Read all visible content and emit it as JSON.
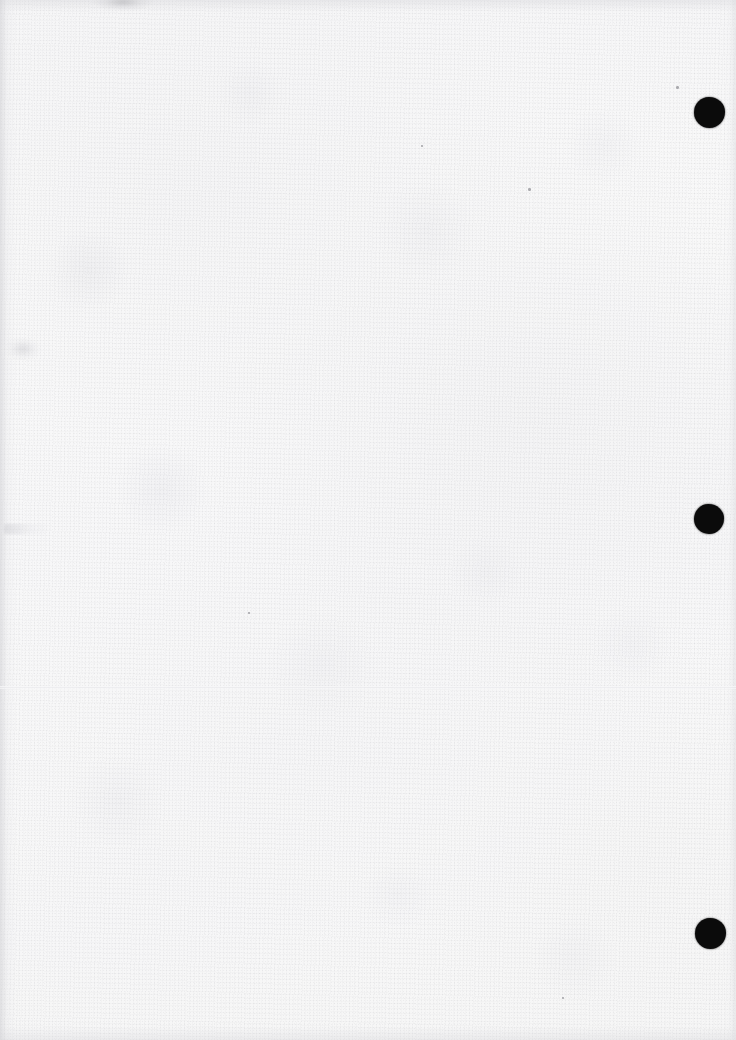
{
  "document": {
    "kind": "scanned-page",
    "title": "Scanned blank sheet",
    "description": "Blank off-white scanned paper page with three punched binding holes along the right edge",
    "page_width": 736,
    "page_height": 1040,
    "visible_text": "",
    "colors": {
      "paper": "#f8f8f8",
      "paper_shade": "#f2f2f3",
      "hole": "#0b0b0b",
      "edge_shadow": "#cecece",
      "smudge": "#a8a8ac"
    }
  },
  "binding_holes": [
    {
      "name": "punch-hole-top",
      "cx": 709,
      "cy": 112,
      "d": 31
    },
    {
      "name": "punch-hole-middle",
      "cx": 709,
      "cy": 519,
      "d": 30
    },
    {
      "name": "punch-hole-bottom",
      "cx": 710,
      "cy": 933,
      "d": 31
    }
  ],
  "marks": {
    "fold_line_y": 687,
    "smudge_top_edge": {
      "x": 95,
      "y": 0
    },
    "smudge_left_mid": {
      "x": 6,
      "y": 338
    },
    "smudge_left_line": {
      "x": 4,
      "y": 524
    },
    "specks": [
      {
        "x": 421,
        "y": 145
      },
      {
        "x": 528,
        "y": 188
      },
      {
        "x": 562,
        "y": 997
      },
      {
        "x": 676,
        "y": 86
      },
      {
        "x": 248,
        "y": 612
      }
    ]
  }
}
